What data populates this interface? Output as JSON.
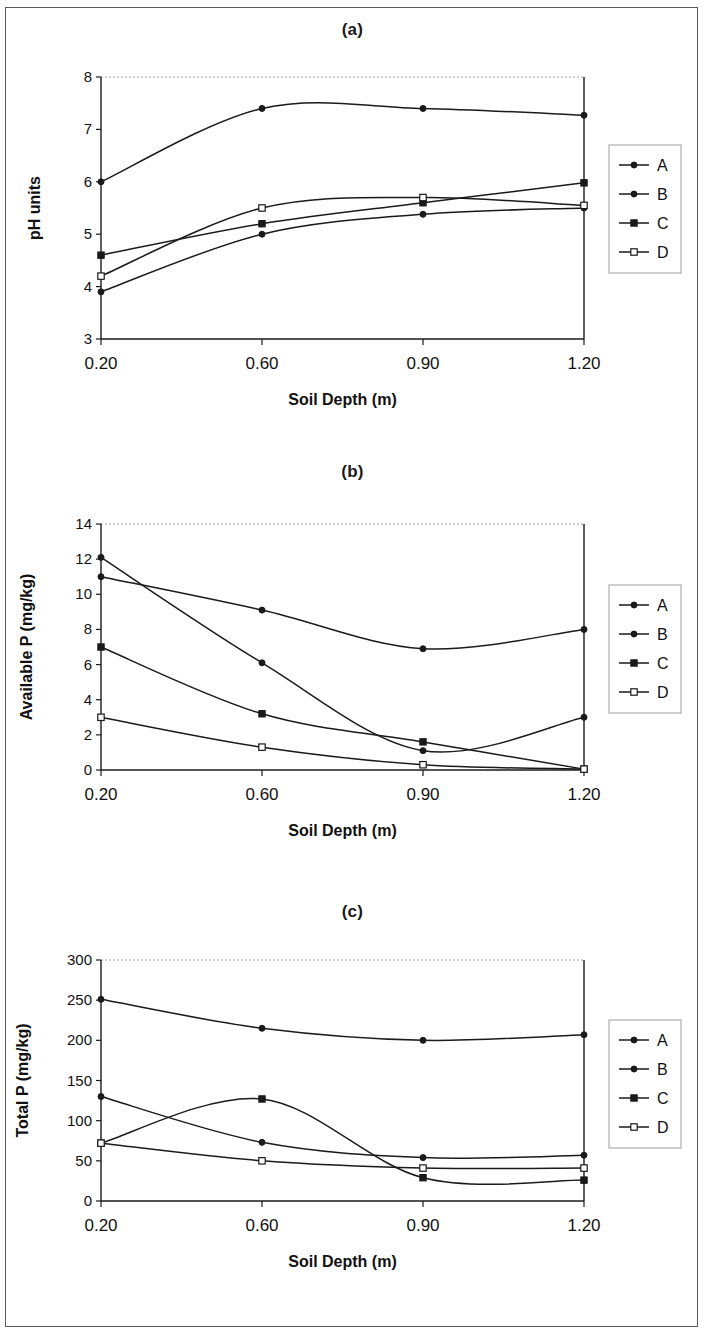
{
  "figure": {
    "panels": [
      "a",
      "b",
      "c"
    ],
    "x_axis_label": "Soil Depth (m)",
    "x_categories": [
      "0.20",
      "0.60",
      "0.90",
      "1.20"
    ],
    "series_names": [
      "A",
      "B",
      "C",
      "D"
    ],
    "legend_position": "right"
  },
  "panel_a": {
    "title": "(a)",
    "ylabel": "pH units",
    "xlabel": "Soil Depth (m)",
    "yticks": [
      "3",
      "4",
      "5",
      "6",
      "7",
      "8"
    ],
    "xticks": [
      "0.20",
      "0.60",
      "0.90",
      "1.20"
    ],
    "legend": [
      "A",
      "B",
      "C",
      "D"
    ]
  },
  "panel_b": {
    "title": "(b)",
    "ylabel": "Available P (mg/kg)",
    "xlabel": "Soil Depth (m)",
    "yticks": [
      "0",
      "2",
      "4",
      "6",
      "8",
      "10",
      "12",
      "14"
    ],
    "xticks": [
      "0.20",
      "0.60",
      "0.90",
      "1.20"
    ],
    "legend": [
      "A",
      "B",
      "C",
      "D"
    ]
  },
  "panel_c": {
    "title": "(c)",
    "ylabel": "Total P (mg/kg)",
    "xlabel": "Soil Depth (m)",
    "yticks": [
      "0",
      "50",
      "100",
      "150",
      "200",
      "250",
      "300"
    ],
    "xticks": [
      "0.20",
      "0.60",
      "0.90",
      "1.20"
    ],
    "legend": [
      "A",
      "B",
      "C",
      "D"
    ]
  },
  "chart_data": [
    {
      "type": "line",
      "title": "(a)",
      "xlabel": "Soil Depth (m)",
      "ylabel": "pH units",
      "categories": [
        "0.20",
        "0.60",
        "0.90",
        "1.20"
      ],
      "x": [
        0.2,
        0.6,
        0.9,
        1.2
      ],
      "ylim": [
        3,
        8
      ],
      "ytick_step": 1,
      "grid": false,
      "legend": "right",
      "series": [
        {
          "name": "A",
          "marker": "filled-diamond",
          "values": [
            6.0,
            7.4,
            7.4,
            7.27
          ]
        },
        {
          "name": "B",
          "marker": "filled-diamond",
          "values": [
            3.9,
            5.0,
            5.38,
            5.5
          ]
        },
        {
          "name": "C",
          "marker": "filled-square",
          "values": [
            4.6,
            5.2,
            5.6,
            5.98
          ]
        },
        {
          "name": "D",
          "marker": "open-square",
          "values": [
            4.2,
            5.5,
            5.7,
            5.55
          ]
        }
      ]
    },
    {
      "type": "line",
      "title": "(b)",
      "xlabel": "Soil Depth (m)",
      "ylabel": "Available P (mg/kg)",
      "categories": [
        "0.20",
        "0.60",
        "0.90",
        "1.20"
      ],
      "x": [
        0.2,
        0.6,
        0.9,
        1.2
      ],
      "ylim": [
        0,
        14
      ],
      "ytick_step": 2,
      "grid": false,
      "legend": "right",
      "series": [
        {
          "name": "A",
          "marker": "filled-diamond",
          "values": [
            11.0,
            9.1,
            6.9,
            8.0
          ]
        },
        {
          "name": "B",
          "marker": "filled-diamond",
          "values": [
            12.1,
            6.1,
            1.1,
            3.0
          ]
        },
        {
          "name": "C",
          "marker": "filled-square",
          "values": [
            7.0,
            3.2,
            1.6,
            0.05
          ]
        },
        {
          "name": "D",
          "marker": "open-square",
          "values": [
            3.0,
            1.3,
            0.3,
            0.05
          ]
        }
      ]
    },
    {
      "type": "line",
      "title": "(c)",
      "xlabel": "Soil Depth (m)",
      "ylabel": "Total P (mg/kg)",
      "categories": [
        "0.20",
        "0.60",
        "0.90",
        "1.20"
      ],
      "x": [
        0.2,
        0.6,
        0.9,
        1.2
      ],
      "ylim": [
        0,
        300
      ],
      "ytick_step": 50,
      "grid": false,
      "legend": "right",
      "series": [
        {
          "name": "A",
          "marker": "filled-diamond",
          "values": [
            251,
            215,
            200,
            207
          ]
        },
        {
          "name": "B",
          "marker": "filled-diamond",
          "values": [
            130,
            73,
            54,
            57
          ]
        },
        {
          "name": "C",
          "marker": "filled-square",
          "values": [
            72,
            127,
            29,
            26
          ]
        },
        {
          "name": "D",
          "marker": "open-square",
          "values": [
            72,
            50,
            41,
            41
          ]
        }
      ]
    }
  ]
}
